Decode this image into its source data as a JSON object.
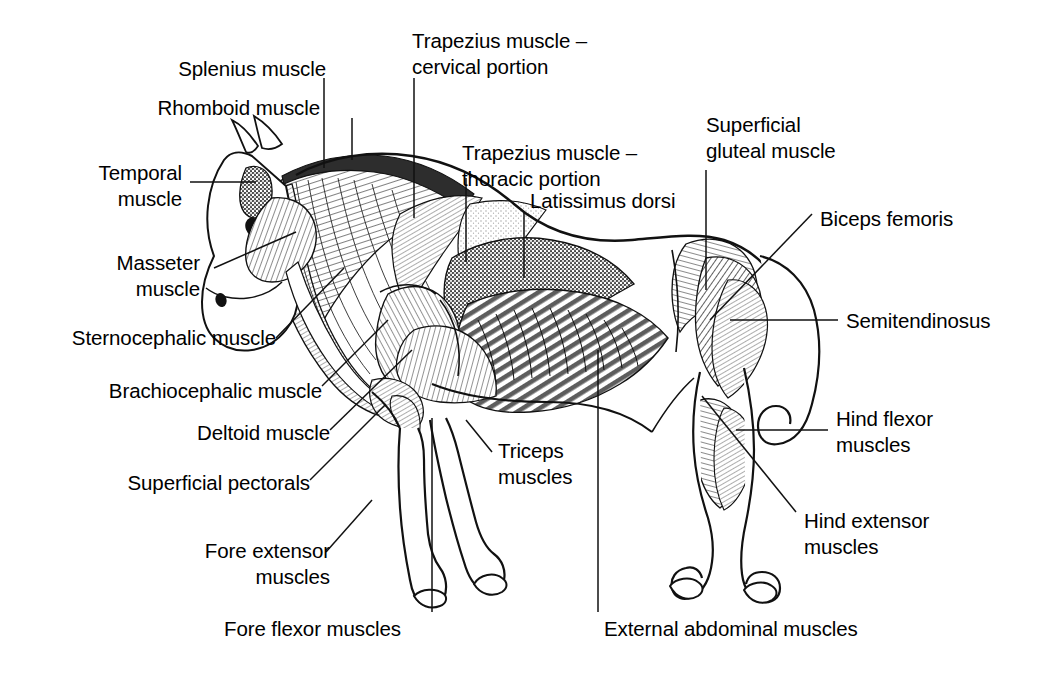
{
  "figure": {
    "type": "anatomical-line-drawing",
    "ink_color": "#000000",
    "background_color": "#ffffff"
  },
  "labels": {
    "splenius": "Splenius muscle",
    "rhomboid": "Rhomboid muscle",
    "temporal": "Temporal\nmuscle",
    "masseter": "Masseter\nmuscle",
    "sternocephalic": "Sternocephalic muscle",
    "brachiocephalic": "Brachiocephalic muscle",
    "deltoid": "Deltoid muscle",
    "superficial_pectorals": "Superficial pectorals",
    "fore_extensor": "Fore extensor\nmuscles",
    "fore_flexor": "Fore flexor muscles",
    "trapezius_cervical": "Trapezius muscle –\ncervical portion",
    "trapezius_thoracic": "Trapezius muscle –\nthoracic portion",
    "latissimus_dorsi": "Latissimus dorsi",
    "triceps": "Triceps\nmuscles",
    "external_abdominal": "External abdominal muscles",
    "superficial_gluteal": "Superficial\ngluteal muscle",
    "biceps_femoris": "Biceps femoris",
    "semitendinosus": "Semitendinosus",
    "hind_flexor": "Hind flexor\nmuscles",
    "hind_extensor": "Hind extensor\nmuscles"
  }
}
